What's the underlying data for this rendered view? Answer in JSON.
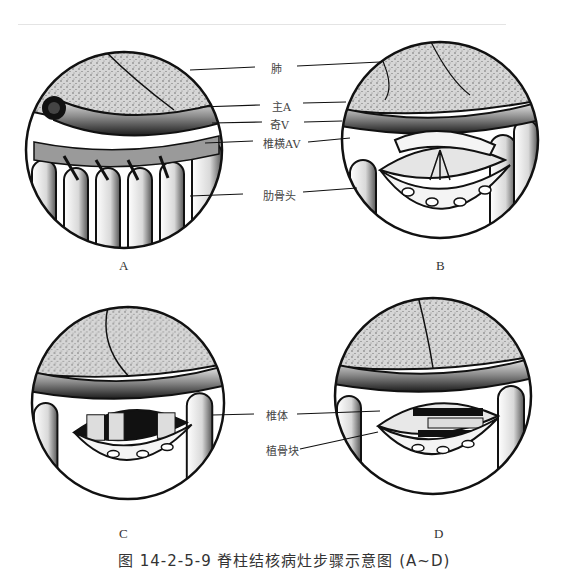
{
  "figure": {
    "panels": [
      {
        "id": "A",
        "label": "A"
      },
      {
        "id": "B",
        "label": "B"
      },
      {
        "id": "C",
        "label": "C"
      },
      {
        "id": "D",
        "label": "D"
      }
    ],
    "callouts_top": [
      {
        "label": "肺"
      },
      {
        "label": "主A"
      },
      {
        "label": "奇V"
      },
      {
        "label": "椎横AV"
      },
      {
        "label": "肋骨头"
      }
    ],
    "callouts_bottom": [
      {
        "label": "椎体"
      },
      {
        "label": "植骨块"
      }
    ],
    "caption": "图 14-2-5-9  脊柱结核病灶步骤示意图 (A~D)",
    "colors": {
      "line": "#111111",
      "lung_fill": "#cfcfcf",
      "vessel_dark": "#1a1a1a",
      "background": "#ffffff"
    }
  }
}
